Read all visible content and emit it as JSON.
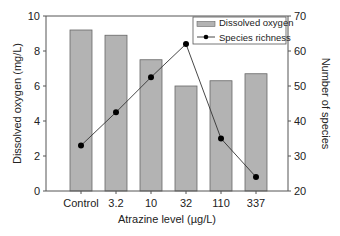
{
  "chart_data": {
    "type": "bar",
    "title": "",
    "xlabel": "Atrazine level (µg/L)",
    "ylabel": "Dissolved oxygen (mg/L)",
    "y2label": "Number of species",
    "categories": [
      "Control",
      "3.2",
      "10",
      "32",
      "110",
      "337"
    ],
    "ylim": [
      0,
      10
    ],
    "y2lim": [
      20,
      70
    ],
    "yticks": [
      0,
      2,
      4,
      6,
      8,
      10
    ],
    "y2ticks": [
      20,
      30,
      40,
      50,
      60,
      70
    ],
    "grid": false,
    "legend_position": "upper right",
    "series": [
      {
        "name": "Dissolved oxygen",
        "type": "bar",
        "axis": "left",
        "color": "#b3b3b3",
        "values": [
          9.2,
          8.9,
          7.5,
          6.0,
          6.3,
          6.7
        ]
      },
      {
        "name": "Species richness",
        "type": "line",
        "axis": "right",
        "color": "#000000",
        "values": [
          33,
          42.5,
          52.5,
          62,
          35,
          24
        ]
      }
    ]
  },
  "legend": {
    "items": [
      "Dissolved oxygen",
      "Species richness"
    ]
  }
}
